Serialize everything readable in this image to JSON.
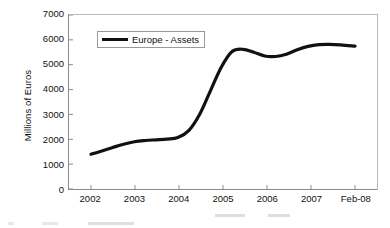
{
  "chart_data": {
    "type": "line",
    "title": "",
    "xlabel": "",
    "ylabel": "Millions of Euros",
    "categories": [
      "2002",
      "2003",
      "2004",
      "2005",
      "2006",
      "2007",
      "Feb-08"
    ],
    "x_tick_labels": [
      "2002",
      "2003",
      "2004",
      "2005",
      "2006",
      "2007",
      "Feb-08"
    ],
    "y_tick_labels": [
      "0",
      "1000",
      "2000",
      "3000",
      "4000",
      "5000",
      "6000",
      "7000"
    ],
    "y_ticks": [
      0,
      1000,
      2000,
      3000,
      4000,
      5000,
      6000,
      7000
    ],
    "ylim": [
      0,
      7000
    ],
    "grid": false,
    "legend_position": "top-left-inside",
    "series": [
      {
        "name": "Europe - Assets",
        "color": "#111111",
        "values": [
          1400,
          1900,
          2050,
          5600,
          5350,
          5800,
          5750
        ],
        "dense_x": [
          2002.0,
          2002.25,
          2002.5,
          2002.75,
          2003.0,
          2003.25,
          2003.5,
          2003.75,
          2004.0,
          2004.25,
          2004.5,
          2004.75,
          2005.0,
          2005.25,
          2005.5,
          2005.75,
          2006.0,
          2006.25,
          2006.5,
          2006.75,
          2007.0,
          2007.25,
          2007.5,
          2007.75,
          2008.08
        ],
        "dense_y": [
          1400,
          1530,
          1670,
          1800,
          1900,
          1950,
          1980,
          2010,
          2070,
          2350,
          3000,
          3950,
          4900,
          5530,
          5620,
          5500,
          5350,
          5330,
          5420,
          5600,
          5740,
          5810,
          5820,
          5800,
          5750
        ]
      }
    ],
    "legend": [
      {
        "label": "Europe - Assets",
        "color": "#111111"
      }
    ]
  },
  "axes": {
    "y_title": "Millions of Euros"
  }
}
